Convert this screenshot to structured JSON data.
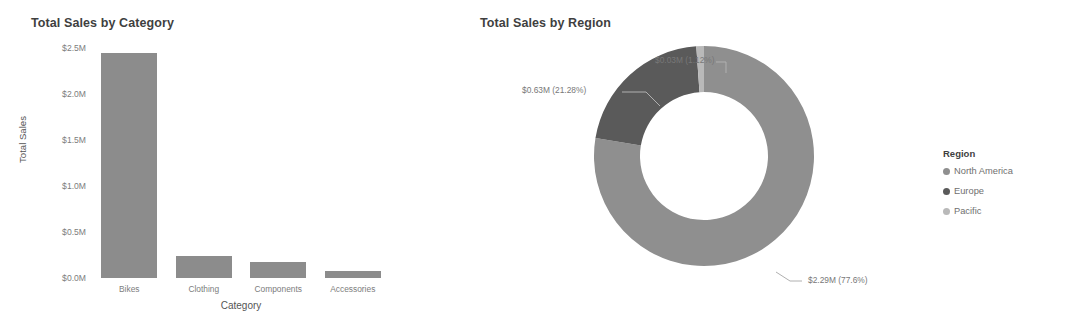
{
  "chart_data": [
    {
      "type": "bar",
      "title": "Total Sales by Category",
      "xlabel": "Category",
      "ylabel": "Total Sales",
      "categories": [
        "Bikes",
        "Clothing",
        "Components",
        "Accessories"
      ],
      "values": [
        2450000,
        240000,
        170000,
        80000
      ],
      "value_labels": [
        "$2.45M",
        "$0.24M",
        "$0.17M",
        "$0.08M"
      ],
      "ytick_labels": [
        "$2.5M",
        "$2.0M",
        "$1.5M",
        "$1.0M",
        "$0.5M",
        "$0.0M"
      ],
      "ytick_values": [
        2500000,
        2000000,
        1500000,
        1000000,
        500000,
        0
      ],
      "ylim": [
        0,
        2500000
      ],
      "grid": false,
      "legend": "none",
      "bar_color": "#8c8c8c"
    },
    {
      "type": "pie",
      "subtype": "donut",
      "title": "Total Sales by Region",
      "legend_title": "Region",
      "legend_position": "right",
      "slices": [
        {
          "name": "North America",
          "value": 2290000,
          "percent": 77.6,
          "label": "$2.29M (77.6%)",
          "color": "#8f8f8f"
        },
        {
          "name": "Europe",
          "value": 630000,
          "percent": 21.28,
          "label": "$0.63M (21.28%)",
          "color": "#5a5a5a"
        },
        {
          "name": "Pacific",
          "value": 30000,
          "percent": 1.12,
          "label": "$0.03M (1.12%)",
          "color": "#b9b9b9"
        }
      ]
    }
  ],
  "bar": {
    "title": "Total Sales by Category",
    "ylabel": "Total Sales",
    "xlabel": "Category",
    "yticks": [
      "$2.5M",
      "$2.0M",
      "$1.5M",
      "$1.0M",
      "$0.5M",
      "$0.0M"
    ],
    "xticks": [
      "Bikes",
      "Clothing",
      "Components",
      "Accessories"
    ]
  },
  "donut": {
    "title": "Total Sales by Region",
    "labels": {
      "pacific": "$0.03M (1.12%)",
      "europe": "$0.63M (21.28%)",
      "north_america": "$2.29M (77.6%)"
    }
  },
  "legend": {
    "title": "Region",
    "items": [
      {
        "label": "North America",
        "color": "#8f8f8f"
      },
      {
        "label": "Europe",
        "color": "#5a5a5a"
      },
      {
        "label": "Pacific",
        "color": "#b9b9b9"
      }
    ]
  }
}
